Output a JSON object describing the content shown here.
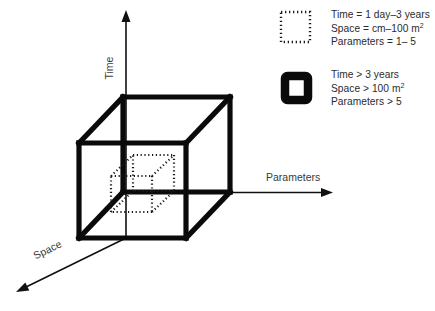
{
  "figure": {
    "type": "conceptual-3d-cube-diagram",
    "background_color": "#ffffff",
    "line_color": "#0a0a0a",
    "text_color": "#2b2b2b"
  },
  "axes": {
    "time": {
      "label": "Time",
      "orientation": "vertical-up"
    },
    "parameters": {
      "label": "Parameters",
      "orientation": "horizontal-right"
    },
    "space": {
      "label": "Space",
      "orientation": "diagonal-down-left"
    }
  },
  "cubes": {
    "outer": {
      "style": "thick-solid",
      "meaning": "large domain"
    },
    "inner": {
      "style": "dotted",
      "meaning": "small domain"
    }
  },
  "legend": {
    "items": [
      {
        "swatch": "dotted-square-icon",
        "lines": [
          {
            "pre": "Time = 1 day–3 years",
            "sup": "",
            "post": ""
          },
          {
            "pre": "Space =  cm–100 m",
            "sup": "2",
            "post": ""
          },
          {
            "pre": "Parameters = 1– 5",
            "sup": "",
            "post": ""
          }
        ]
      },
      {
        "swatch": "thick-square-icon",
        "lines": [
          {
            "pre": "Time > 3 years",
            "sup": "",
            "post": ""
          },
          {
            "pre": "Space > 100 m",
            "sup": "2",
            "post": ""
          },
          {
            "pre": "Parameters > 5",
            "sup": "",
            "post": ""
          }
        ]
      }
    ]
  }
}
